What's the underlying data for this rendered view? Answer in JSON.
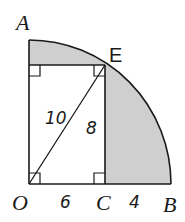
{
  "diagram": {
    "type": "geometry-quarter-circle",
    "points": {
      "O": "O",
      "A": "A",
      "B": "B",
      "C": "C",
      "E": "E"
    },
    "measurements": {
      "OE": "10",
      "CE": "8",
      "OC": "6",
      "CB": "4"
    },
    "colors": {
      "stroke": "#1a1a1a",
      "shade": "#cfcfcf"
    }
  }
}
